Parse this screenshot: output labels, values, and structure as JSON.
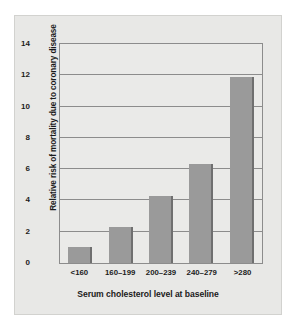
{
  "chart_data": {
    "type": "bar",
    "title": "",
    "subtitle": "",
    "xlabel": "Serum cholesterol level at baseline",
    "ylabel": "Relative risk of mortality due to coronary disease",
    "categories": [
      "<160",
      "160–199",
      "200–239",
      "240–279",
      ">280"
    ],
    "values": [
      1.0,
      2.3,
      4.3,
      6.3,
      11.9
    ],
    "ylim": [
      0,
      14
    ],
    "yticks": [
      0,
      2,
      4,
      6,
      8,
      10,
      12,
      14
    ],
    "ytick_labels": [
      "0",
      "2",
      "4",
      "6",
      "8",
      "10",
      "12",
      "14"
    ],
    "grid": true,
    "grid_axis": "y",
    "legend": false,
    "legend_position": "none",
    "bar_color": "#9a9a9a",
    "bar_edge_color": "#6f6f6f",
    "plot_background": "#eaeae8",
    "figure_background": "#e8e8e6",
    "axis_color": "#8c8c8c",
    "text_color": "#1b1b1b"
  }
}
